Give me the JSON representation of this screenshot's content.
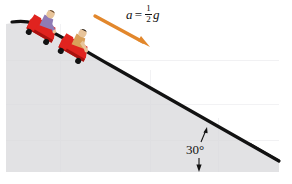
{
  "figure": {
    "background_color": "#ffffff"
  },
  "incline": {
    "name": "hillside",
    "fill_color": "#e2e2e4",
    "edge_color": "#111111",
    "angle_degrees": 30,
    "flat_top_y": 22,
    "base_y": 172
  },
  "annotations": {
    "acceleration": {
      "variable": "a",
      "equals": "=",
      "fraction_numerator": "1",
      "fraction_denominator": "2",
      "gravity_symbol": "g",
      "full_text": "a = 1/2 g"
    },
    "angle": {
      "label": "30°",
      "value": 30,
      "unit": "degrees"
    }
  },
  "arrow": {
    "name": "acceleration-arrow",
    "color": "#e2872c",
    "direction": "down-slope",
    "start": [
      96,
      17
    ],
    "end": [
      149,
      46
    ]
  },
  "carts": [
    {
      "name": "upper-cart",
      "body_color": "#e0231f",
      "body_shadow_color": "#a8120f",
      "wheel_color": "#121212",
      "rider_shirt_color": "#8f7bb5",
      "rider_skin_color": "#e8c49a",
      "rider_hair_color": "#6b4a2a"
    },
    {
      "name": "lower-cart",
      "body_color": "#e0231f",
      "body_shadow_color": "#a8120f",
      "wheel_color": "#121212",
      "rider_shirt_color": "#d9a05a",
      "rider_skin_color": "#e8c49a",
      "rider_hair_color": "#241a12"
    }
  ]
}
